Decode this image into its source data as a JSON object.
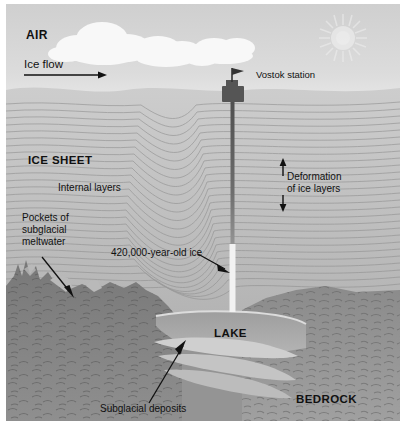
{
  "figure": {
    "labels": {
      "air": "AIR",
      "ice_flow": "Ice flow",
      "vostok_station": "Vostok station",
      "ice_sheet": "ICE SHEET",
      "internal_layers": "Internal layers",
      "deformation": "Deformation\nof ice layers",
      "pockets": "Pockets of\nsubglacial\nmeltwater",
      "old_ice": "420,000-year-old ice",
      "lake": "LAKE",
      "subglacial_deposits": "Subglacial deposits",
      "bedrock": "BEDROCK"
    },
    "colors": {
      "sky": "#d2d2d2",
      "cloud": "#f7f7f7",
      "sun": "#e4e4e4",
      "ice": "#c0c0c0",
      "ice_layer_line": "#8e8e8e",
      "bedrock_dark": "#6b6b6b",
      "bedrock_mid": "#8a8a8a",
      "bedrock_light": "#9b9b9b",
      "lake_water": "#a9a9a9",
      "deposits": "#c9c9c9",
      "borehole": "#5a5a5a",
      "old_ice_core": "#f2f2f2",
      "station": "#555555",
      "text": "#111111",
      "arrow": "#111111"
    }
  }
}
